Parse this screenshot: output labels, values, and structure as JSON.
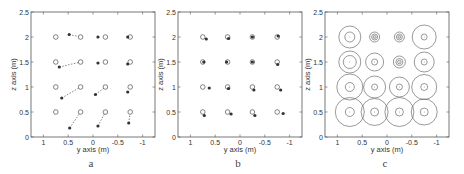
{
  "chart_data": [
    {
      "type": "scatter",
      "panel": "a",
      "title": "",
      "xlabel": "y axis (m)",
      "ylabel": "z axis (m)",
      "xlim": [
        1.25,
        -1.25
      ],
      "ylim": [
        0,
        2.5
      ],
      "xticks": [
        "1",
        "0.5",
        "0",
        "-0.5",
        "-1"
      ],
      "yticks": [
        "0",
        "0.5",
        "1",
        "1.5",
        "2",
        "2.5"
      ],
      "grid": false,
      "series": [
        {
          "name": "reference (open circles)",
          "marker": "open-circle",
          "points": [
            [
              0.75,
              2
            ],
            [
              0.25,
              2
            ],
            [
              -0.25,
              2
            ],
            [
              -0.75,
              2
            ],
            [
              0.75,
              1.5
            ],
            [
              0.25,
              1.5
            ],
            [
              -0.25,
              1.5
            ],
            [
              -0.75,
              1.5
            ],
            [
              0.75,
              1
            ],
            [
              0.25,
              1
            ],
            [
              -0.25,
              1
            ],
            [
              -0.75,
              1
            ],
            [
              0.75,
              0.5
            ],
            [
              0.25,
              0.5
            ],
            [
              -0.25,
              0.5
            ],
            [
              -0.75,
              0.5
            ]
          ]
        },
        {
          "name": "estimated (filled dots)",
          "marker": "filled-dot",
          "points": [
            [
              0.48,
              2.05
            ],
            [
              -0.1,
              2.0
            ],
            [
              -0.7,
              2.0
            ],
            [
              0.68,
              1.4
            ],
            [
              -0.1,
              1.48
            ],
            [
              -0.7,
              1.46
            ],
            [
              0.63,
              0.78
            ],
            [
              -0.05,
              0.85
            ],
            [
              -0.7,
              0.9
            ],
            [
              0.47,
              0.18
            ],
            [
              -0.1,
              0.22
            ],
            [
              -0.72,
              0.28
            ]
          ]
        }
      ],
      "links": [
        [
          [
            0.48,
            2.05
          ],
          [
            0.25,
            2
          ]
        ],
        [
          [
            0.68,
            1.4
          ],
          [
            0.25,
            1.5
          ]
        ],
        [
          [
            0.63,
            0.78
          ],
          [
            0.25,
            1
          ]
        ],
        [
          [
            -0.05,
            0.85
          ],
          [
            -0.25,
            1
          ]
        ],
        [
          [
            0.47,
            0.18
          ],
          [
            0.25,
            0.5
          ]
        ],
        [
          [
            -0.1,
            0.22
          ],
          [
            -0.25,
            0.5
          ]
        ],
        [
          [
            -0.72,
            0.28
          ],
          [
            -0.75,
            0.5
          ]
        ]
      ],
      "caption": "a"
    },
    {
      "type": "scatter",
      "panel": "b",
      "title": "",
      "xlabel": "y axis (m)",
      "ylabel": "z axis (m)",
      "xlim": [
        1.25,
        -1.25
      ],
      "ylim": [
        0,
        2.5
      ],
      "xticks": [
        "1",
        "0.5",
        "0",
        "-0.5",
        "-1"
      ],
      "yticks": [
        "0",
        "0.5",
        "1",
        "1.5",
        "2",
        "2.5"
      ],
      "grid": false,
      "series": [
        {
          "name": "reference (open circles)",
          "marker": "open-circle",
          "points": [
            [
              0.75,
              2
            ],
            [
              0.25,
              2
            ],
            [
              -0.25,
              2
            ],
            [
              -0.75,
              2
            ],
            [
              0.75,
              1.5
            ],
            [
              0.25,
              1.5
            ],
            [
              -0.25,
              1.5
            ],
            [
              -0.75,
              1.5
            ],
            [
              0.75,
              1
            ],
            [
              0.25,
              1
            ],
            [
              -0.25,
              1
            ],
            [
              -0.75,
              1
            ],
            [
              0.75,
              0.5
            ],
            [
              0.25,
              0.5
            ],
            [
              -0.25,
              0.5
            ],
            [
              -0.75,
              0.5
            ]
          ]
        },
        {
          "name": "estimated (filled dots)",
          "marker": "filled-dot",
          "points": [
            [
              0.68,
              1.96
            ],
            [
              0.23,
              1.97
            ],
            [
              -0.25,
              2.0
            ],
            [
              -0.77,
              2.02
            ],
            [
              0.73,
              1.5
            ],
            [
              0.27,
              1.5
            ],
            [
              -0.25,
              1.5
            ],
            [
              -0.76,
              1.45
            ],
            [
              0.62,
              0.98
            ],
            [
              0.23,
              0.97
            ],
            [
              -0.28,
              0.94
            ],
            [
              -0.82,
              0.94
            ],
            [
              0.72,
              0.43
            ],
            [
              0.18,
              0.46
            ],
            [
              -0.3,
              0.43
            ],
            [
              -0.87,
              0.47
            ]
          ]
        }
      ],
      "caption": "b"
    },
    {
      "type": "scatter",
      "panel": "c",
      "title": "",
      "xlabel": "y axis (m)",
      "ylabel": "z axis (m)",
      "xlim": [
        1.25,
        -1.25
      ],
      "ylim": [
        0,
        2.5
      ],
      "xticks": [
        "1",
        "0.5",
        "0",
        "-0.5",
        "-1"
      ],
      "yticks": [
        "0",
        "0.5",
        "1",
        "1.5",
        "2",
        "2.5"
      ],
      "grid": false,
      "series": [
        {
          "name": "uncertainty circles",
          "marker": "concentric-circles",
          "points": [
            {
              "y": 0.75,
              "z": 2,
              "outer_r": 0.22,
              "inner_r": 0.1
            },
            {
              "y": 0.25,
              "z": 2,
              "outer_r": 0.1,
              "inner_r": 0.06,
              "core_r": 0.03
            },
            {
              "y": -0.25,
              "z": 2,
              "outer_r": 0.1,
              "inner_r": 0.06,
              "core_r": 0.03
            },
            {
              "y": -0.75,
              "z": 2,
              "outer_r": 0.24,
              "inner_r": 0.06
            },
            {
              "y": 0.75,
              "z": 1.5,
              "outer_r": 0.22,
              "inner_r": 0.13
            },
            {
              "y": 0.25,
              "z": 1.5,
              "outer_r": 0.18,
              "inner_r": 0.06
            },
            {
              "y": -0.25,
              "z": 1.5,
              "outer_r": 0.12,
              "inner_r": 0.07,
              "core_r": 0.035
            },
            {
              "y": -0.75,
              "z": 1.5,
              "outer_r": 0.2,
              "inner_r": 0.06
            },
            {
              "y": 0.75,
              "z": 1,
              "outer_r": 0.26,
              "inner_r": 0.09
            },
            {
              "y": 0.25,
              "z": 1,
              "outer_r": 0.22,
              "inner_r": 0.06
            },
            {
              "y": -0.25,
              "z": 1,
              "outer_r": 0.2,
              "inner_r": 0.06
            },
            {
              "y": -0.75,
              "z": 1,
              "outer_r": 0.25,
              "inner_r": 0.07
            },
            {
              "y": 0.75,
              "z": 0.5,
              "outer_r": 0.29,
              "inner_r": 0.09
            },
            {
              "y": 0.25,
              "z": 0.5,
              "outer_r": 0.27,
              "inner_r": 0.08
            },
            {
              "y": -0.25,
              "z": 0.5,
              "outer_r": 0.29,
              "inner_r": 0.08
            },
            {
              "y": -0.75,
              "z": 0.5,
              "outer_r": 0.26,
              "inner_r": 0.08
            }
          ]
        }
      ],
      "caption": "c"
    }
  ],
  "panels": [
    {
      "caption": "a",
      "xlabel": "y axis (m)",
      "ylabel": "z axis (m)"
    },
    {
      "caption": "b",
      "xlabel": "y axis (m)",
      "ylabel": "z axis (m)"
    },
    {
      "caption": "c",
      "xlabel": "y axis (m)",
      "ylabel": "z axis (m)"
    }
  ],
  "colors": {
    "axis": "#555555",
    "marker": "#333333",
    "link": "#666666",
    "circle": "#555555"
  }
}
